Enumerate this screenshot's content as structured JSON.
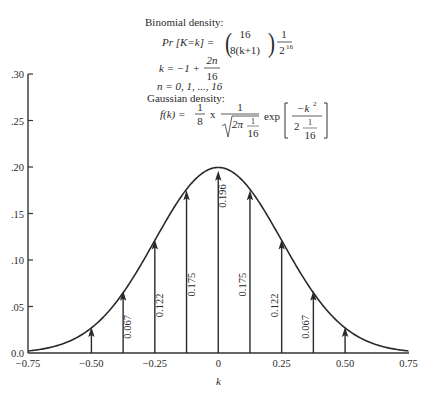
{
  "chart_data": {
    "type": "line",
    "subtype": "stem plot with overlaid gaussian curve",
    "title": "",
    "xlabel": "k",
    "ylabel": "",
    "xlim": [
      -0.75,
      0.75
    ],
    "ylim": [
      0.0,
      0.3
    ],
    "grid": false,
    "x_ticks": [
      -0.75,
      -0.5,
      -0.25,
      0,
      0.25,
      0.5,
      0.75
    ],
    "x_tick_labels": [
      "−0.75",
      "−0.50",
      "−0.25",
      "0",
      "0.25",
      "0.50",
      "0.75"
    ],
    "y_ticks": [
      0.0,
      0.05,
      0.1,
      0.15,
      0.2,
      0.25,
      0.3
    ],
    "y_tick_labels": [
      "0.0",
      ".05",
      ".10",
      ".15",
      ".20",
      ".25",
      ".30"
    ],
    "series": [
      {
        "name": "Binomial density",
        "style": "stem-arrows",
        "x": [
          -0.5,
          -0.375,
          -0.25,
          -0.125,
          0,
          0.125,
          0.25,
          0.375,
          0.5
        ],
        "values": [
          0.028,
          0.067,
          0.122,
          0.175,
          0.196,
          0.175,
          0.122,
          0.067,
          0.028
        ],
        "labels": [
          "",
          "0.067",
          "0.122",
          "0.175",
          "0.196",
          "0.175",
          "0.122",
          "0.067",
          ""
        ]
      },
      {
        "name": "Gaussian density",
        "style": "smooth-line",
        "formula": "f(k) = 1/8 * 1/sqrt(2*pi/16) * exp(-k^2 / (2/16))",
        "peak": 0.1995,
        "variance": 0.0625
      }
    ],
    "annotations": {
      "binomial_heading": "Binomial density:",
      "binomial_formula": {
        "lhs": "Pr [K=k] =",
        "binom_top": "16",
        "binom_bottom": "8(k+1)",
        "frac_num": "1",
        "frac_den": "2",
        "frac_den_exp": "16"
      },
      "k_def": {
        "lhs": "k = −1 +",
        "num": "2n",
        "den": "16"
      },
      "n_def": "n = 0, 1, ..., 16",
      "gaussian_heading": "Gaussian density:",
      "gaussian_formula": {
        "lhs": "f(k) =",
        "c_num": "1",
        "c_den": "8",
        "times": "x",
        "s_num": "1",
        "s_rad": "2π",
        "s_rad_num": "1",
        "s_rad_den": "16",
        "exp": "exp",
        "e_num": "−k",
        "e_num_exp": "2",
        "e_den_a": "2",
        "e_den_num": "1",
        "e_den_den": "16"
      }
    }
  }
}
